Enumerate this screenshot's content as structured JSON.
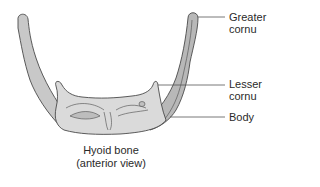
{
  "diagram": {
    "subject": "Hyoid bone",
    "caption_line1": "Hyoid bone",
    "caption_line2": "(anterior view)",
    "labels": [
      {
        "id": "greater-cornu",
        "line1": "Greater",
        "line2": "cornu"
      },
      {
        "id": "lesser-cornu",
        "line1": "Lesser",
        "line2": "cornu"
      },
      {
        "id": "body",
        "line1": "Body",
        "line2": ""
      }
    ],
    "colors": {
      "bone_fill": "#d6d6d6",
      "bone_shadow": "#b4b4b4",
      "outline": "#4a4a4a",
      "leader_line": "#555555",
      "text": "#2a2a2a",
      "background": "#ffffff"
    }
  }
}
